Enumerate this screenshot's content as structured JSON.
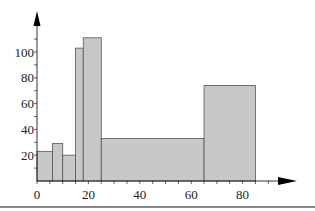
{
  "chart_data": {
    "type": "bar",
    "subtype": "histogram",
    "title": "",
    "xlabel": "",
    "ylabel": "",
    "xlim": [
      0,
      95
    ],
    "ylim": [
      0,
      125
    ],
    "x_ticks": [
      0,
      20,
      40,
      60,
      80
    ],
    "y_ticks": [
      20,
      40,
      60,
      80,
      100
    ],
    "x_minor_step": 5,
    "y_minor_step": 10,
    "grid": false,
    "legend": null,
    "bars": [
      {
        "x0": 0,
        "x1": 6,
        "value": 23
      },
      {
        "x0": 6,
        "x1": 10,
        "value": 29
      },
      {
        "x0": 10,
        "x1": 15,
        "value": 20
      },
      {
        "x0": 15,
        "x1": 18,
        "value": 103
      },
      {
        "x0": 18,
        "x1": 25,
        "value": 111
      },
      {
        "x0": 25,
        "x1": 65,
        "value": 33
      },
      {
        "x0": 65,
        "x1": 85,
        "value": 74
      }
    ],
    "categories": [
      "0-6",
      "6-10",
      "10-15",
      "15-18",
      "18-25",
      "25-65",
      "65-85"
    ],
    "values": [
      23,
      29,
      20,
      103,
      111,
      33,
      74
    ],
    "colors": {
      "bar_fill": "#c8c8c8",
      "bar_edge": "#555555",
      "axis": "#000000"
    }
  }
}
